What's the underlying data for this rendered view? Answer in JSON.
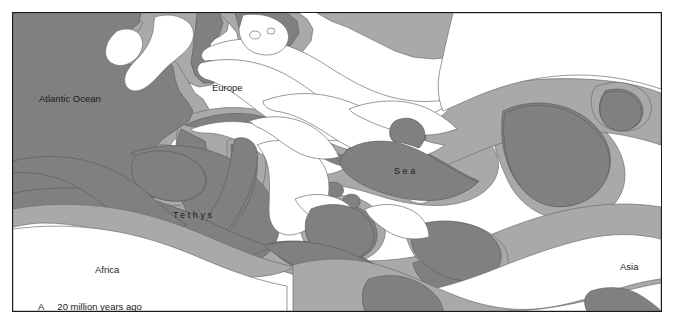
{
  "figure": {
    "panel_letter": "A",
    "caption": "20 million years ago",
    "width_px": 674,
    "height_px": 325
  },
  "colors": {
    "land": "#ffffff",
    "shelf_sea": "#a9a9a9",
    "deep_sea": "#808080",
    "frame": "#1a1a1a",
    "label_text": "#1c1c1c",
    "background": "#ffffff"
  },
  "labels": [
    {
      "id": "atlantic",
      "text": "Atlantic Ocean",
      "x": 26,
      "y": 80,
      "style": "plain"
    },
    {
      "id": "europe",
      "text": "Europe",
      "x": 199,
      "y": 69,
      "style": "plain"
    },
    {
      "id": "sea",
      "text": "Sea",
      "x": 381,
      "y": 153,
      "style": "spaced"
    },
    {
      "id": "tethys",
      "text": "Tethys",
      "x": 160,
      "y": 197,
      "style": "spaced"
    },
    {
      "id": "africa",
      "text": "Africa",
      "x": 82,
      "y": 251,
      "style": "plain"
    },
    {
      "id": "asia",
      "text": "Asia",
      "x": 607,
      "y": 248,
      "style": "plain"
    }
  ],
  "legend_description": {
    "deep_sea": "dark grey = deep ocean / Tethys Ocean basin",
    "shelf_sea": "medium grey = shallow shelf seas",
    "land": "white = emergent land"
  }
}
